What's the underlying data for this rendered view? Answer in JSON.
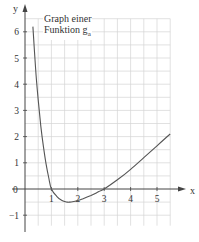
{
  "chart_data": {
    "type": "line",
    "title_line1": "Graph einer",
    "title_line2_prefix": "Funktion g",
    "title_subscript": "a",
    "xlabel": "x",
    "ylabel": "y",
    "origin_label": "0",
    "xlim": [
      0,
      5.5
    ],
    "ylim": [
      -1.5,
      6.5
    ],
    "x_ticks": [
      1,
      2,
      3,
      4,
      5
    ],
    "x_tick_labels": [
      "1",
      "2",
      "3",
      "4",
      "5"
    ],
    "y_ticks": [
      -1,
      1,
      2,
      3,
      4,
      5,
      6
    ],
    "y_tick_labels": [
      "-1",
      "1",
      "2",
      "3",
      "4",
      "5",
      "6"
    ],
    "grid": true,
    "grid_step": 0.5,
    "legend": "none",
    "series": [
      {
        "name": "g_a",
        "x": [
          0.3,
          0.4,
          0.5,
          0.6,
          0.7,
          0.8,
          0.9,
          1.0,
          1.2,
          1.4,
          1.6,
          1.7,
          1.8,
          2.0,
          2.2,
          2.5,
          2.8,
          3.0,
          3.5,
          4.0,
          4.5,
          5.0,
          5.5
        ],
        "y": [
          6.2,
          4.6,
          3.4,
          2.4,
          1.6,
          0.95,
          0.42,
          0.0,
          -0.28,
          -0.44,
          -0.5,
          -0.5,
          -0.49,
          -0.44,
          -0.37,
          -0.25,
          -0.1,
          0.0,
          0.35,
          0.75,
          1.2,
          1.65,
          2.1
        ]
      }
    ],
    "features": {
      "zeros": [
        1,
        3
      ],
      "minimum": {
        "x": 1.7,
        "y": -0.5
      }
    }
  },
  "colors": {
    "grid": "#d4d4d4",
    "axis": "#444444",
    "curve": "#555555",
    "text": "#333333"
  }
}
